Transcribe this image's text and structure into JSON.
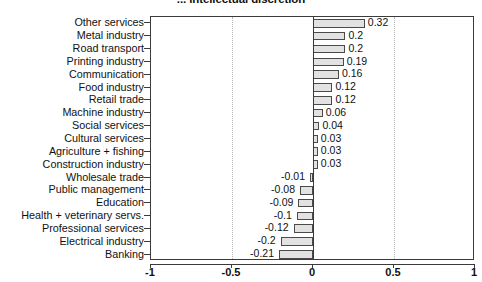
{
  "chart_data": {
    "type": "bar",
    "orientation": "horizontal",
    "title": "... intellectual discretion",
    "xlabel": "",
    "ylabel": "",
    "xlim": [
      -1,
      1
    ],
    "xticks": [
      -1,
      -0.5,
      0,
      0.5,
      1
    ],
    "xtick_labels": [
      "-1",
      "-0.5",
      "0",
      "0.5",
      "1"
    ],
    "grid": true,
    "gridlines_at": [
      -0.5,
      0.5
    ],
    "zero_line": 0,
    "legend": null,
    "bar_fill_color": "#e2e2e2",
    "bar_edge_color": "#4a4a4a",
    "categories": [
      "Other services",
      "Metal industry",
      "Road transport",
      "Printing industry",
      "Communication",
      "Food industry",
      "Retail trade",
      "Machine industry",
      "Social services",
      "Cultural services",
      "Agriculture + fishing",
      "Construction industry",
      "Wholesale trade",
      "Public management",
      "Education",
      "Health + veterinary servs.",
      "Professional services",
      "Electrical industry",
      "Banking"
    ],
    "values": [
      0.32,
      0.2,
      0.2,
      0.19,
      0.16,
      0.12,
      0.12,
      0.06,
      0.04,
      0.03,
      0.03,
      0.03,
      -0.01,
      -0.08,
      -0.09,
      -0.1,
      -0.12,
      -0.2,
      -0.21
    ],
    "value_labels": [
      "0.32",
      "0.2",
      "0.2",
      "0.19",
      "0.16",
      "0.12",
      "0.12",
      "0.06",
      "0.04",
      "0.03",
      "0.03",
      "0.03",
      "-0.01",
      "-0.08",
      "-0.09",
      "-0.1",
      "-0.12",
      "-0.2",
      "-0.21"
    ]
  }
}
